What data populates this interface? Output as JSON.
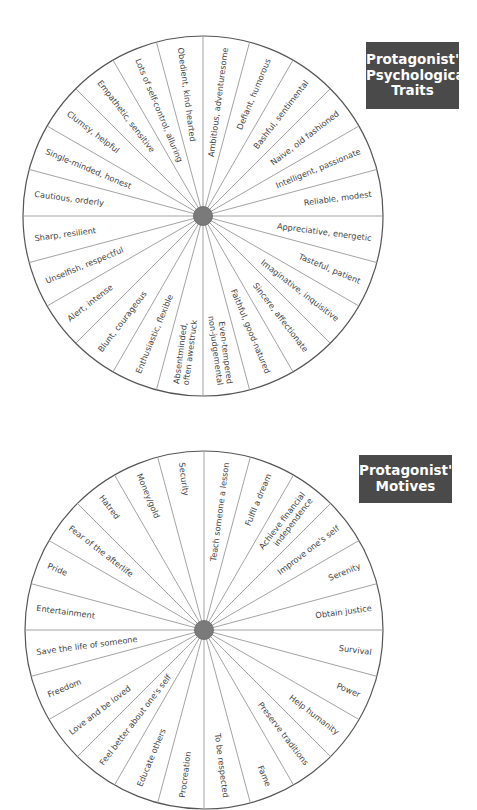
{
  "wheels": [
    {
      "id": "traits",
      "title_lines": [
        "Protagonist's",
        "Psychological",
        "Traits"
      ],
      "title_box": {
        "x": 366,
        "y": 42,
        "w": 93,
        "h": 67,
        "font": 13.5
      },
      "center": {
        "x": 203,
        "y": 216
      },
      "radius": 180,
      "hub_color": "#7a7a7a",
      "line_color": "#999999",
      "rim_color": "#555555",
      "labels": [
        [
          "Ambitious, adventuresome"
        ],
        [
          "Defiant, humorous"
        ],
        [
          "Bashful, sentimental"
        ],
        [
          "Naive, old fashioned"
        ],
        [
          "Intelligent, passionate"
        ],
        [
          "Reliable, modest"
        ],
        [
          "Appreciative, energetic"
        ],
        [
          "Tasteful, patient"
        ],
        [
          "Imaginative, inquisitive"
        ],
        [
          "Sincere, affectionate"
        ],
        [
          "Faithful, good-natured"
        ],
        [
          "Even-tempered",
          "non-judgemental"
        ],
        [
          "Absentminded,",
          "often awestruck"
        ],
        [
          "Enthusiastic, flexible"
        ],
        [
          "Blunt, courageous"
        ],
        [
          "Alert, intense"
        ],
        [
          "Unselfish, respectful"
        ],
        [
          "Sharp, resilient"
        ],
        [
          "Cautious, orderly"
        ],
        [
          "Single-minded, honest"
        ],
        [
          "Clumsy, helpful"
        ],
        [
          "Empathetic, sensitive"
        ],
        [
          "Lots of self-control, alluring"
        ],
        [
          "Obedient, kind hearted"
        ]
      ]
    },
    {
      "id": "motives",
      "title_lines": [
        "Protagonist's",
        "Motives"
      ],
      "title_box": {
        "x": 359,
        "y": 455,
        "w": 93,
        "h": 48,
        "font": 13.5
      },
      "center": {
        "x": 204,
        "y": 630
      },
      "radius": 179,
      "hub_color": "#7a7a7a",
      "line_color": "#999999",
      "rim_color": "#555555",
      "labels": [
        [
          "Teach someone a lesson"
        ],
        [
          "Fulfil a dream"
        ],
        [
          "Achieve financial",
          "independence"
        ],
        [
          "Improve one's self"
        ],
        [
          "Serenity"
        ],
        [
          "Obtain justice"
        ],
        [
          "Survival"
        ],
        [
          "Power"
        ],
        [
          "Help humanity"
        ],
        [
          "Preserve traditions"
        ],
        [
          "Fame"
        ],
        [
          "To be respected"
        ],
        [
          "Procreation"
        ],
        [
          "Educate others"
        ],
        [
          "Feel better about one's self"
        ],
        [
          "Love and be loved"
        ],
        [
          "Freedom"
        ],
        [
          "Save the life of someone"
        ],
        [
          "Entertainment"
        ],
        [
          "Pride"
        ],
        [
          "Fear of the afterlife"
        ],
        [
          "Hatred"
        ],
        [
          "Money/gold"
        ],
        [
          "Security"
        ]
      ]
    }
  ]
}
